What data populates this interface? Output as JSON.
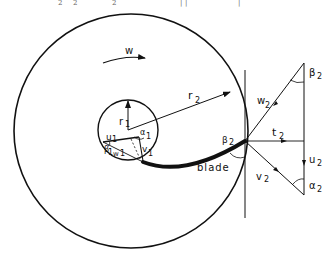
{
  "figure": {
    "type": "impeller-velocity-diagram",
    "top_truncated_text": [
      "2",
      "2",
      "2",
      "|",
      "|",
      "|"
    ],
    "labels": {
      "omega": "w",
      "r1_main": "r",
      "r1_sub": "1",
      "r2_main": "r",
      "r2_sub": "2",
      "alpha1_main": "α",
      "alpha1_sub": "1",
      "u1_main": "u",
      "u1_sub": "1",
      "beta1_main": "β",
      "beta1_sub": "1",
      "w1_main": "w",
      "w1_sub": "1",
      "v1_main": "v",
      "v1_sub": "1",
      "beta2_blade_main": "β",
      "beta2_blade_sub": "2",
      "blade": "blade",
      "w2_main": "w",
      "w2_sub": "2",
      "t2_main": "t",
      "t2_sub": "2",
      "u2_main": "u",
      "u2_sub": "2",
      "v2_main": "v",
      "v2_sub": "2",
      "beta2_main": "β",
      "beta2_sub": "2",
      "alpha2_main": "α",
      "alpha2_sub": "2"
    },
    "colors": {
      "stroke": "#111111",
      "background": "#ffffff"
    }
  }
}
